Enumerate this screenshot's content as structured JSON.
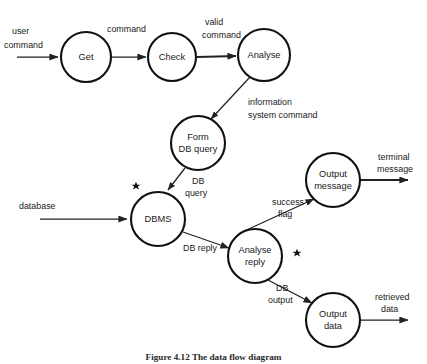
{
  "figure": {
    "type": "data-flow-diagram",
    "caption": "Figure 4.12  The data flow diagram",
    "width": 427,
    "height": 364,
    "colors": {
      "background": "#ffffff",
      "stroke": "#111111",
      "text": "#1a1a1a"
    }
  },
  "nodes": [
    {
      "id": "get",
      "label_line1": "Get",
      "label_line2": "",
      "cx": 86,
      "cy": 57,
      "r": 25,
      "starred": false
    },
    {
      "id": "check",
      "label_line1": "Check",
      "label_line2": "",
      "cx": 172,
      "cy": 57,
      "r": 24,
      "starred": false
    },
    {
      "id": "analyse",
      "label_line1": "Analyse",
      "label_line2": "",
      "cx": 264,
      "cy": 55,
      "r": 26,
      "starred": false
    },
    {
      "id": "form-db-query",
      "label_line1": "Form",
      "label_line2": "DB query",
      "cx": 198,
      "cy": 143,
      "r": 27,
      "starred": false
    },
    {
      "id": "dbms",
      "label_line1": "DBMS",
      "label_line2": "",
      "cx": 158,
      "cy": 219,
      "r": 27,
      "starred": true
    },
    {
      "id": "analyse-reply",
      "label_line1": "Analyse",
      "label_line2": "reply",
      "cx": 255,
      "cy": 256,
      "r": 27,
      "starred": true
    },
    {
      "id": "output-message",
      "label_line1": "Output",
      "label_line2": "message",
      "cx": 333,
      "cy": 180,
      "r": 27,
      "starred": false
    },
    {
      "id": "output-data",
      "label_line1": "Output",
      "label_line2": "data",
      "cx": 333,
      "cy": 320,
      "r": 27,
      "starred": false
    }
  ],
  "edges": [
    {
      "id": "user-command",
      "label_line1": "user",
      "label_line2": "command",
      "from": "external-input",
      "to": "get"
    },
    {
      "id": "command",
      "label_line1": "command",
      "label_line2": "",
      "from": "get",
      "to": "check"
    },
    {
      "id": "valid-command",
      "label_line1": "valid",
      "label_line2": "command",
      "from": "check",
      "to": "analyse"
    },
    {
      "id": "information-system-command",
      "label_line1": "information",
      "label_line2": "system command",
      "from": "analyse",
      "to": "form-db-query"
    },
    {
      "id": "db-query",
      "label_line1": "DB",
      "label_line2": "query",
      "from": "form-db-query",
      "to": "dbms"
    },
    {
      "id": "database",
      "label_line1": "database",
      "label_line2": "",
      "from": "external-input",
      "to": "dbms"
    },
    {
      "id": "db-reply",
      "label_line1": "DB reply",
      "label_line2": "",
      "from": "dbms",
      "to": "analyse-reply"
    },
    {
      "id": "success-flag",
      "label_line1": "success",
      "label_line2": "flag",
      "from": "analyse-reply",
      "to": "output-message"
    },
    {
      "id": "db-output",
      "label_line1": "DB",
      "label_line2": "output",
      "from": "analyse-reply",
      "to": "output-data"
    },
    {
      "id": "terminal-message",
      "label_line1": "terminal",
      "label_line2": "message",
      "from": "output-message",
      "to": "external-output"
    },
    {
      "id": "retrieved-data",
      "label_line1": "retrieved",
      "label_line2": "data",
      "from": "output-data",
      "to": "external-output"
    }
  ],
  "star_markers": [
    {
      "id": "star-dbms",
      "x": 136,
      "y": 186,
      "annotates": "dbms"
    },
    {
      "id": "star-analyse-reply",
      "x": 297,
      "y": 253,
      "annotates": "analyse-reply"
    }
  ]
}
